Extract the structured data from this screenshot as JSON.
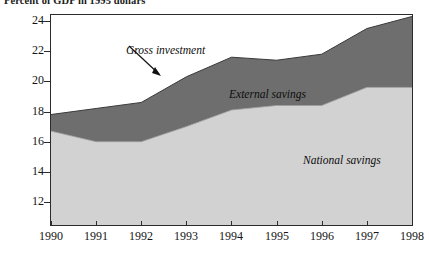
{
  "title": "Percent of GDP in 1995 dollars",
  "colors": {
    "external_savings_band": "#6e6e6e",
    "national_savings_band": "#d2d2d2",
    "axis": "#2b2b2b",
    "text": "#141414",
    "background": "#ffffff"
  },
  "annotations": {
    "gross_investment": "Gross investment",
    "external_savings": "External savings",
    "national_savings": "National savings"
  },
  "axes": {
    "y_ticks": [
      "24",
      "22",
      "20",
      "18",
      "16",
      "14",
      "12"
    ],
    "x_ticks": [
      "1990",
      "1991",
      "1992",
      "1993",
      "1994",
      "1995",
      "1996",
      "1997",
      "1998"
    ]
  },
  "chart_data": {
    "type": "area",
    "title": "Percent of GDP in 1995 dollars",
    "subtitle": "",
    "xlabel": "",
    "ylabel": "",
    "stacked": true,
    "grid": false,
    "legend_position": "inline-annotations",
    "ylim": [
      11,
      25
    ],
    "xlim": [
      1990,
      1998
    ],
    "categories": [
      "1990",
      "1991",
      "1992",
      "1993",
      "1994",
      "1995",
      "1996",
      "1997",
      "1998"
    ],
    "x": [
      1990,
      1991,
      1992,
      1993,
      1994,
      1995,
      1996,
      1997,
      1998
    ],
    "series": [
      {
        "name": "National savings",
        "kind": "lower-band",
        "color": "#d2d2d2",
        "values": [
          16.7,
          16.0,
          16.0,
          17.0,
          18.1,
          18.4,
          18.4,
          19.6,
          19.6
        ]
      },
      {
        "name": "Gross investment",
        "kind": "upper-boundary",
        "color": "#6e6e6e",
        "values": [
          17.8,
          18.2,
          18.6,
          20.3,
          21.6,
          21.4,
          21.8,
          23.5,
          24.3
        ]
      },
      {
        "name": "External savings",
        "kind": "difference-band",
        "color": "#6e6e6e",
        "values": [
          1.1,
          2.2,
          2.6,
          3.3,
          3.5,
          3.0,
          3.4,
          3.9,
          4.7
        ]
      }
    ]
  }
}
